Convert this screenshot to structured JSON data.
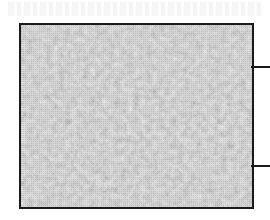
{
  "figure": {
    "texture": {
      "style": "grayscale-mosaic",
      "base_color": "#a2a2a2",
      "dark_cell_color": "#6a6a6a",
      "light_cell_color": "#d8d8d8",
      "border_color": "#1a1a1a"
    },
    "leader_lines": [
      {
        "position": "upper-right",
        "color": "#1a1a1a"
      },
      {
        "position": "lower-right",
        "color": "#1a1a1a"
      }
    ]
  }
}
